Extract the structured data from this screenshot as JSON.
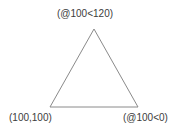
{
  "diagram": {
    "type": "triangle-outline-with-coordinate-labels",
    "background_color": "#ffffff",
    "stroke_color": "#8a8a8a",
    "stroke_width": 1,
    "text_color": "#3c3c3c",
    "vertices": [
      {
        "name": "apex",
        "x": 94,
        "y": 29
      },
      {
        "name": "base-left",
        "x": 50,
        "y": 107
      },
      {
        "name": "base-right",
        "x": 138,
        "y": 107
      }
    ],
    "labels": {
      "apex": "(@100<120)",
      "base_left": "(100,100)",
      "base_right": "(@100<0)"
    }
  }
}
